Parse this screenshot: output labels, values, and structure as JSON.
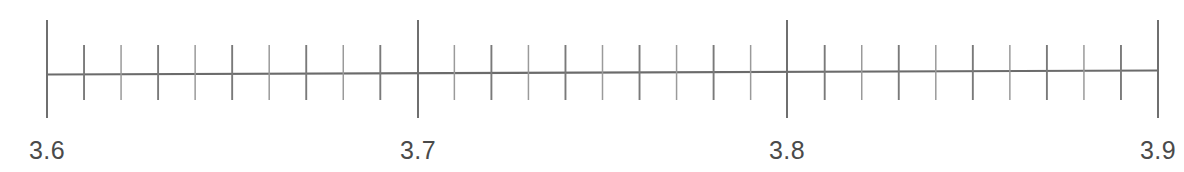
{
  "figure": {
    "kind": "number-line",
    "background_color": "#ffffff",
    "stroke_color": "#6f6f6f",
    "label_color": "#4a4a4a",
    "width": 1184,
    "height": 172
  },
  "chart_data": {
    "type": "line",
    "title": "",
    "subtitle": "",
    "xlabel": "",
    "ylabel": "",
    "grid": false,
    "legend": null,
    "orientation": "horizontal",
    "axis": {
      "min": 3.6,
      "max": 3.9,
      "xlim": [
        3.6,
        3.9
      ],
      "major_step": 0.1,
      "minor_step": 0.01,
      "minor_divisions_per_major": 10,
      "minor_ticks_between_majors": 9,
      "baseline_y_px": 73,
      "start_x_px": 47,
      "end_x_px": 1158,
      "major_tick_top_px": 20,
      "major_tick_bottom_px": 118,
      "minor_tick_top_px": 45,
      "minor_tick_bottom_px": 100
    },
    "major_ticks": [
      {
        "value": 3.6,
        "label": "3.6",
        "x_px": 47
      },
      {
        "value": 3.7,
        "label": "3.7",
        "x_px": 418
      },
      {
        "value": 3.8,
        "label": "3.8",
        "x_px": 787
      },
      {
        "value": 3.9,
        "label": "3.9",
        "x_px": 1158
      }
    ],
    "tick_labels": [
      "3.6",
      "3.7",
      "3.8",
      "3.9"
    ],
    "minor_tick_values": [
      3.61,
      3.62,
      3.63,
      3.64,
      3.65,
      3.66,
      3.67,
      3.68,
      3.69,
      3.71,
      3.72,
      3.73,
      3.74,
      3.75,
      3.76,
      3.77,
      3.78,
      3.79,
      3.81,
      3.82,
      3.83,
      3.84,
      3.85,
      3.86,
      3.87,
      3.88,
      3.89
    ],
    "series": [],
    "values": [],
    "annotations": [],
    "data_points": []
  }
}
